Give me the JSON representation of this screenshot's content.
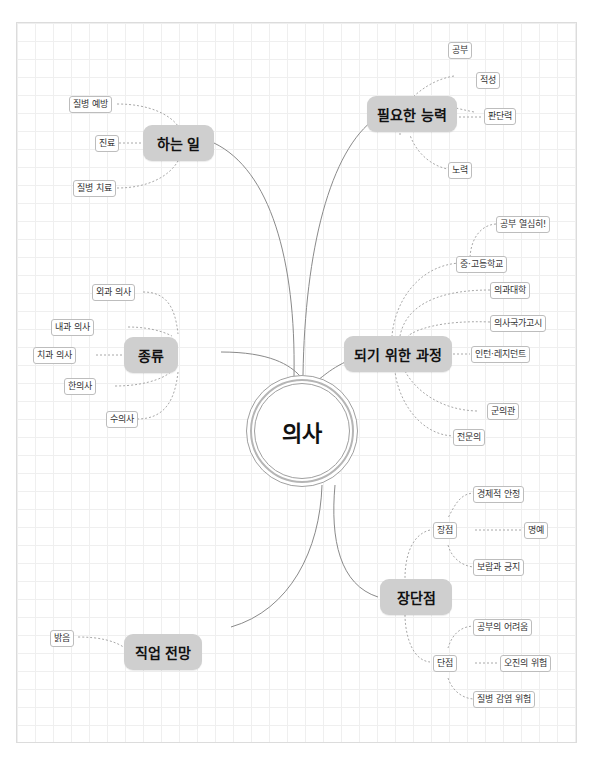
{
  "central": {
    "label": "의사"
  },
  "topics": {
    "work": {
      "label": "하는 일",
      "children": [
        "질병 예방",
        "진료",
        "질병 치료"
      ]
    },
    "ability": {
      "label": "필요한 능력",
      "children": [
        "공부",
        "적성",
        "판단력",
        "노력"
      ]
    },
    "kinds": {
      "label": "종류",
      "children": [
        "외과 의사",
        "내과 의사",
        "치과 의사",
        "한의사",
        "수의사"
      ]
    },
    "path": {
      "label": "되기 위한 과정",
      "children": [
        "중·고등학교",
        "의과대학",
        "의사국가고시",
        "인턴·레지던트",
        "군의관",
        "전문의"
      ],
      "grandchild": "공부 열심히!"
    },
    "prosCons": {
      "label": "장단점",
      "pros": {
        "label": "장점",
        "children": [
          "경제적 안정",
          "명예",
          "보람과 긍지"
        ]
      },
      "cons": {
        "label": "단점",
        "children": [
          "공부의 어려움",
          "오진의 위험",
          "질병 감염 위험"
        ]
      }
    },
    "outlook": {
      "label": "직업 전망",
      "children": [
        "밝음"
      ]
    }
  },
  "colors": {
    "topic_fill": "#cfcfcf",
    "line": "#8a8a8a",
    "dash": "#a8a8a8",
    "grid": "#efefef"
  }
}
